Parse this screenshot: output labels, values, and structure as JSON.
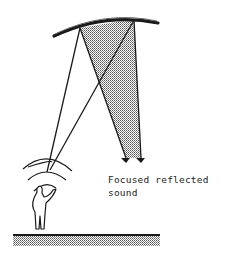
{
  "diagram": {
    "caption_line1": "Focused reflected",
    "caption_line2": "sound",
    "elements": {
      "reflector": "curved-ceiling-reflector",
      "source": "person-speaking",
      "waves": "sound-wave-arcs",
      "ground": "ground-floor",
      "rays": "reflected-sound-rays",
      "focus_region": "shaded-focus-zone"
    },
    "colors": {
      "ink": "#1a1a1a",
      "shade": "#c8c8c8",
      "background": "#ffffff"
    }
  }
}
